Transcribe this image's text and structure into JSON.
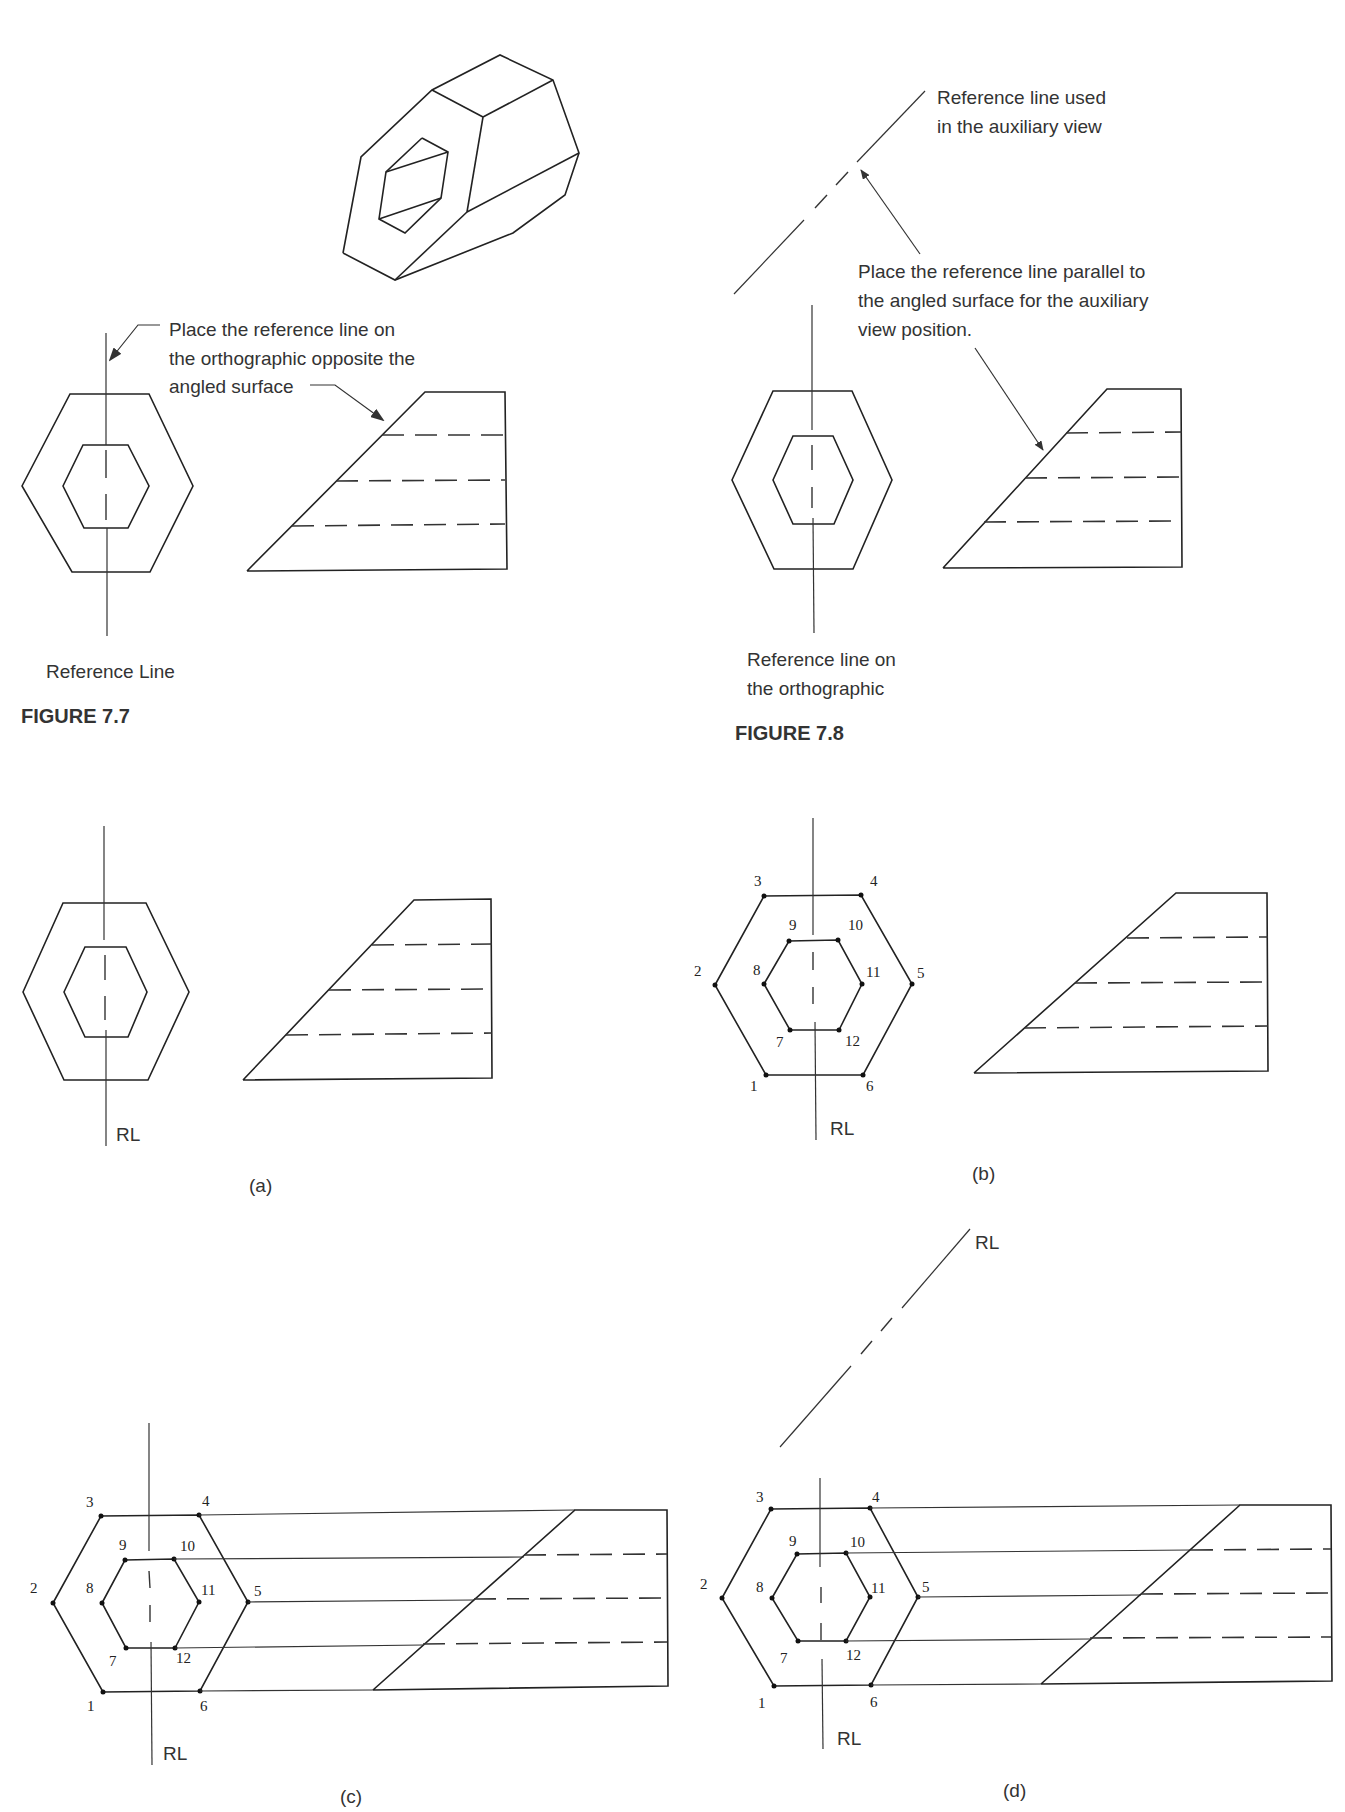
{
  "figure_7_7": {
    "caption": "FIGURE 7.7",
    "callout_1": {
      "line1": "Place the reference line on",
      "line2": "the orthographic opposite the",
      "line3": "angled surface"
    },
    "label_reference_line": "Reference Line"
  },
  "figure_7_8": {
    "caption": "FIGURE 7.8",
    "callout_aux_rl": {
      "line1": "Reference line used",
      "line2": "in the auxiliary view"
    },
    "callout_parallel": {
      "line1": "Place the reference line parallel to",
      "line2": "the angled surface for the auxiliary",
      "line3": "view position."
    },
    "label_rl_ortho": {
      "line1": "Reference line on",
      "line2": "the orthographic"
    }
  },
  "figure_7_9": {
    "panels": {
      "a": {
        "label": "(a)",
        "rl": "RL"
      },
      "b": {
        "label": "(b)",
        "rl": "RL"
      },
      "c": {
        "label": "(c)",
        "rl": "RL"
      },
      "d": {
        "label": "(d)",
        "rl": "RL",
        "rl_aux": "RL"
      }
    },
    "point_numbers": [
      "1",
      "2",
      "3",
      "4",
      "5",
      "6",
      "7",
      "8",
      "9",
      "10",
      "11",
      "12"
    ]
  }
}
